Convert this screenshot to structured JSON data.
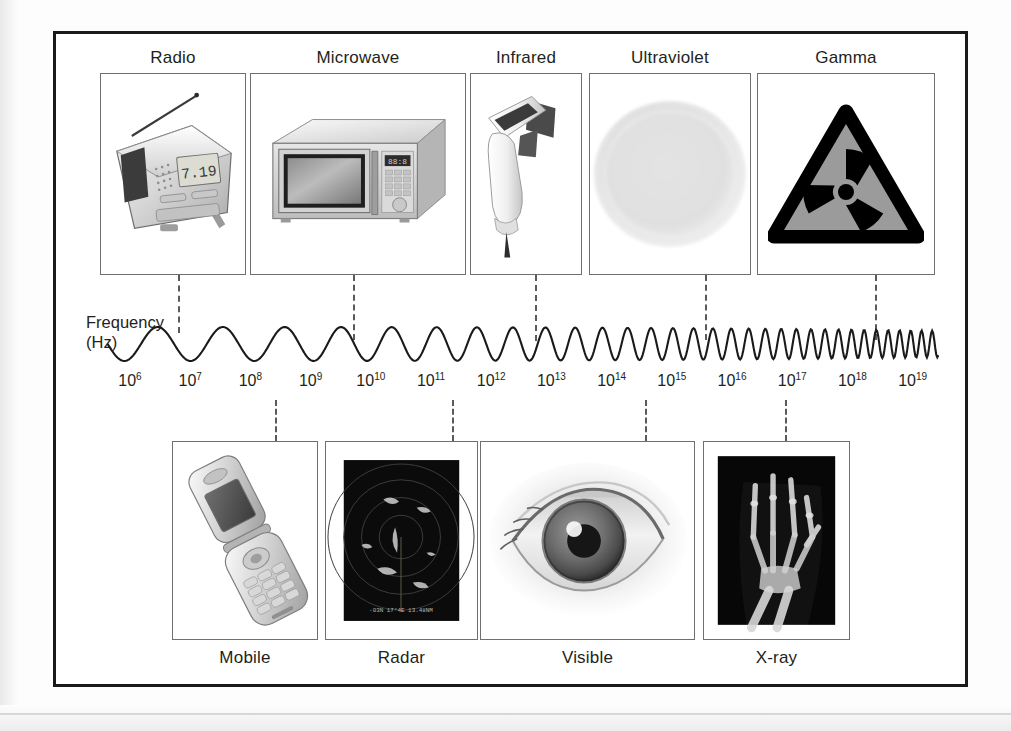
{
  "figure": {
    "axis_label_line1": "Frequency",
    "axis_label_line2": "(Hz)"
  },
  "top_categories": [
    {
      "label": "Radio",
      "image_alt": "portable radio with antenna and digital clock display",
      "clock_value": "7.19"
    },
    {
      "label": "Microwave",
      "image_alt": "countertop microwave oven"
    },
    {
      "label": "Infrared",
      "image_alt": "infrared thermometer gun"
    },
    {
      "label": "Ultraviolet",
      "image_alt": "glowing ultraviolet disc"
    },
    {
      "label": "Gamma",
      "image_alt": "radiation hazard trefoil warning sign"
    }
  ],
  "bottom_categories": [
    {
      "label": "Mobile",
      "image_alt": "flip mobile phone"
    },
    {
      "label": "Radar",
      "image_alt": "radar scope display"
    },
    {
      "label": "Visible",
      "image_alt": "human eye close-up"
    },
    {
      "label": "X-ray",
      "image_alt": "x-ray of a human hand"
    }
  ],
  "chart_data": {
    "type": "line",
    "xlabel": "Frequency (Hz)",
    "ylabel": "",
    "grid": false,
    "legend": "none",
    "x_tick_labels": [
      "10⁶",
      "10⁷",
      "10⁸",
      "10⁹",
      "10¹⁰",
      "10¹¹",
      "10¹²",
      "10¹³",
      "10¹⁴",
      "10¹⁵",
      "10¹⁶",
      "10¹⁷",
      "10¹⁸",
      "10¹⁹"
    ],
    "x_exponents": [
      6,
      7,
      8,
      9,
      10,
      11,
      12,
      13,
      14,
      15,
      16,
      17,
      18,
      19
    ],
    "annotations": [
      {
        "text": "Radio",
        "exponent_marker": 7.0,
        "side": "top"
      },
      {
        "text": "Microwave",
        "exponent_marker": 10.0,
        "side": "top"
      },
      {
        "text": "Infrared",
        "exponent_marker": 13.0,
        "side": "top"
      },
      {
        "text": "Ultraviolet",
        "exponent_marker": 15.8,
        "side": "top"
      },
      {
        "text": "Gamma",
        "exponent_marker": 18.6,
        "side": "top"
      },
      {
        "text": "Mobile",
        "exponent_marker": 8.4,
        "side": "bottom"
      },
      {
        "text": "Radar",
        "exponent_marker": 11.4,
        "side": "bottom"
      },
      {
        "text": "Visible",
        "exponent_marker": 14.6,
        "side": "bottom"
      },
      {
        "text": "X-ray",
        "exponent_marker": 17.0,
        "side": "bottom"
      }
    ]
  },
  "colors": {
    "frame": "#1a1a1a",
    "box_border": "#6f6f6f",
    "text": "#231f20",
    "dash": "#5a5a5a",
    "wave": "#1a1a1a",
    "gamma_fill": "#9b9b9b"
  }
}
